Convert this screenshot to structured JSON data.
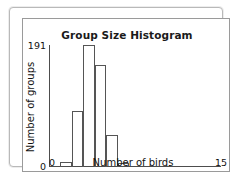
{
  "chart_data": {
    "type": "bar",
    "title": "Group Size Histogram",
    "xlabel": "Number of birds",
    "ylabel": "Number of groups",
    "grid": false,
    "legend": null,
    "xlim": [
      0,
      15
    ],
    "ylim": [
      0,
      191
    ],
    "xtick_labels": [
      "0",
      "15"
    ],
    "ytick_labels": [
      "191",
      "0"
    ],
    "bin_width": 1,
    "bins": [
      {
        "x0": 1,
        "x1": 2,
        "value": 8
      },
      {
        "x0": 2,
        "x1": 3,
        "value": 88
      },
      {
        "x0": 3,
        "x1": 4,
        "value": 191
      },
      {
        "x0": 4,
        "x1": 5,
        "value": 160
      },
      {
        "x0": 5,
        "x1": 6,
        "value": 50
      },
      {
        "x0": 6,
        "x1": 7,
        "value": 6
      }
    ],
    "categories": [
      "1-2",
      "2-3",
      "3-4",
      "4-5",
      "5-6",
      "6-7"
    ],
    "values": [
      8,
      88,
      191,
      160,
      50,
      6
    ]
  },
  "style": {
    "bar_edge_color": "#555555",
    "bar_fill_color": "transparent",
    "axis_color": "#4d4d4d",
    "frame_color": "#9a9a9a",
    "outer_frame_color": "#b9b9b9",
    "text_color": "#111111",
    "background": "#ffffff"
  }
}
